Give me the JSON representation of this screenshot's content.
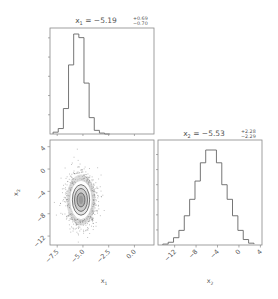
{
  "chart_data": [
    {
      "type": "bar",
      "panel": "top-left histogram",
      "title": "x_1 = -5.19 +0.69 -0.70",
      "title_parts": {
        "var": "x",
        "sub": "1",
        "value": "−5.19",
        "plus": "+0.69",
        "minus": "−0.70"
      },
      "xlabel": "",
      "ylabel": "",
      "xlim": [
        -8.2,
        1.9
      ],
      "bin_edges": [
        -7.9,
        -7.4,
        -6.9,
        -6.4,
        -5.9,
        -5.4,
        -4.9,
        -4.4,
        -3.9,
        -3.4,
        -2.9,
        -2.4
      ],
      "values": [
        1,
        3,
        14,
        38,
        55,
        53,
        28,
        9,
        2,
        0.5,
        0
      ],
      "grid": false
    },
    {
      "type": "scatter",
      "panel": "bottom-left 2D density with contours",
      "xlabel": "x_1",
      "ylabel": "x_2",
      "xlim": [
        -8.2,
        1.9
      ],
      "ylim": [
        -13.6,
        5.2
      ],
      "xticks": [
        "−7.5",
        "−5.0",
        "−2.5",
        "0.0"
      ],
      "xtick_values": [
        -7.5,
        -5.0,
        -2.5,
        0.0
      ],
      "yticks": [
        "4",
        "0",
        "−4",
        "−8",
        "−12"
      ],
      "ytick_values": [
        4,
        0,
        -4,
        -8,
        -12
      ],
      "center": [
        -5.19,
        -5.53
      ],
      "sigma": [
        0.7,
        2.28
      ],
      "contour_levels_sigma": [
        0.5,
        1.0,
        1.5,
        2.0
      ]
    },
    {
      "type": "bar",
      "panel": "bottom-right histogram",
      "title": "x_2 = -5.53 +2.28 -2.29",
      "title_parts": {
        "var": "x",
        "sub": "2",
        "value": "−5.53",
        "plus": "+2.28",
        "minus": "−2.29"
      },
      "xlabel": "x_2",
      "xlim": [
        -15.1,
        4.3
      ],
      "xticks": [
        "−12",
        "−8",
        "−4",
        "0",
        "4"
      ],
      "xtick_values": [
        -12,
        -8,
        -4,
        0,
        4
      ],
      "bin_edges": [
        -14.2,
        -13.2,
        -12.2,
        -11.2,
        -10.2,
        -9.2,
        -8.2,
        -7.2,
        -6.2,
        -5.2,
        -4.2,
        -3.2,
        -2.2,
        -1.2,
        -0.2,
        0.8,
        1.8,
        2.8
      ],
      "values": [
        0.5,
        1.5,
        4,
        8,
        16,
        25,
        35,
        45,
        52,
        52,
        45,
        33,
        25,
        16,
        8,
        3,
        1,
        0.5
      ],
      "grid": false
    }
  ],
  "labels": {
    "x1_axis": "x",
    "x1_sub": "1",
    "x2_axis": "x",
    "x2_sub": "2"
  },
  "colors": {
    "line": "#666666",
    "scatter": "#777777",
    "contour": "#555555",
    "frame": "#888888"
  }
}
